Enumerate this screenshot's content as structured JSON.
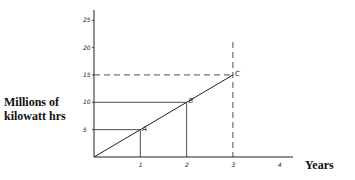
{
  "chart_data": {
    "type": "line",
    "title": "",
    "xlabel": "Years",
    "ylabel": "Millions of kilowatt hrs",
    "x_ticks": [
      1,
      2,
      3,
      4
    ],
    "y_ticks": [
      5,
      10,
      15,
      20,
      25
    ],
    "xlim": [
      0,
      4.3
    ],
    "ylim": [
      0,
      27
    ],
    "grid": false,
    "series": [
      {
        "name": "Output",
        "x": [
          0,
          1,
          2,
          3
        ],
        "y": [
          0,
          5,
          10,
          15
        ]
      }
    ],
    "points": [
      {
        "label": "A",
        "x": 1,
        "y": 5,
        "guide_style": "solid"
      },
      {
        "label": "B",
        "x": 2,
        "y": 10,
        "guide_style": "solid"
      },
      {
        "label": "C",
        "x": 3,
        "y": 15,
        "guide_style": "dashed"
      }
    ]
  },
  "labels": {
    "ylabel_line1": "Millions of",
    "ylabel_line2": "kilowatt hrs",
    "xlabel": "Years"
  }
}
